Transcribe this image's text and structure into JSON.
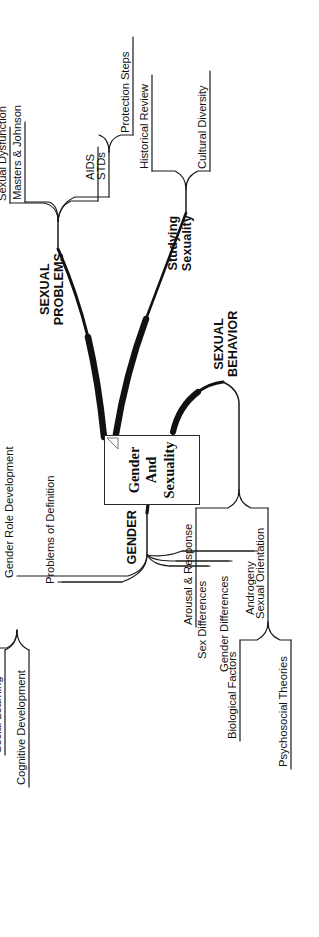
{
  "document": {
    "type": "mind-map",
    "orientation": "rotated-90-ccw",
    "background_color": "#ffffff",
    "ink_color": "#111111"
  },
  "center": {
    "title_line1": "Gender And",
    "title_line2": "Sexuality",
    "title": "Gender And Sexuality",
    "has_dog_ear": true,
    "has_root_dot": true
  },
  "branches": [
    {
      "id": "gender",
      "label_line1": "GENDER",
      "label_line2": "",
      "label": "GENDER",
      "children": [
        {
          "label": "Problems of Definition",
          "children": []
        },
        {
          "label": "Gender Role Development",
          "children": [
            {
              "label": "Social Learning"
            },
            {
              "label": "Cognitive Development"
            }
          ]
        },
        {
          "label": "Sex Differences",
          "children": []
        },
        {
          "label": "Gender Differences",
          "children": []
        },
        {
          "label": "Androgeny",
          "children": []
        }
      ]
    },
    {
      "id": "sexual-behavior",
      "label_line1": "SEXUAL",
      "label_line2": "BEHAVIOR",
      "label": "SEXUAL BEHAVIOR",
      "children": [
        {
          "label": "Arousal & Response",
          "children": []
        },
        {
          "label": "Sexual Orientation",
          "children": [
            {
              "label": "Biological Factors"
            },
            {
              "label": "Psychosocial Theories"
            }
          ]
        }
      ]
    },
    {
      "id": "sexual-problems",
      "label_line1": "SEXUAL",
      "label_line2": "PROBLEMS",
      "label": "SEXUAL PROBLEMS",
      "children": [
        {
          "label": "Sexual Dysfunction",
          "children": []
        },
        {
          "label": "Masters & Johnson",
          "children": []
        },
        {
          "label": "AIDS",
          "children": []
        },
        {
          "label": "STDs",
          "children": [
            {
              "label": "Protection Steps"
            }
          ]
        }
      ]
    },
    {
      "id": "studying-sexuality",
      "label_line1": "Studying",
      "label_line2": "Sexuality",
      "label": "Studying Sexuality",
      "children": [
        {
          "label": "Historical Review",
          "children": []
        },
        {
          "label": "Cultural Diversity",
          "children": []
        }
      ]
    }
  ]
}
